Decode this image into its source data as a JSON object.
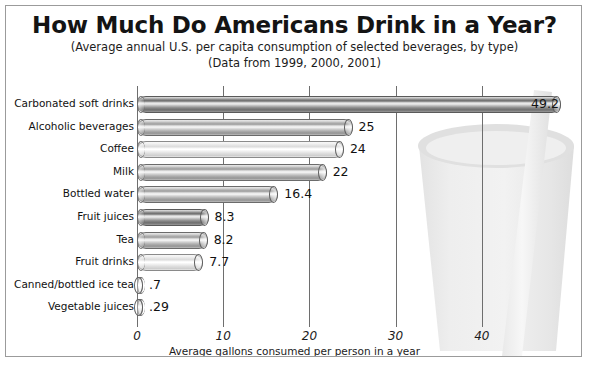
{
  "chart_data": {
    "type": "bar",
    "orientation": "horizontal",
    "title": "How Much Do Americans Drink in a Year?",
    "subtitle1": "(Average annual U.S. per capita consumption of selected beverages, by type)",
    "subtitle2": "(Data from 1999, 2000, 2001)",
    "xlabel": "Average gallons consumed per person in a year",
    "ylabel": "",
    "xlim": [
      0,
      50
    ],
    "xticks": [
      0,
      10,
      20,
      30,
      40
    ],
    "xtick_labels": [
      "0",
      "10",
      "20",
      "30",
      "40"
    ],
    "grid": true,
    "legend": "none",
    "categories": [
      "Carbonated soft drinks",
      "Alcoholic beverages",
      "Coffee",
      "Milk",
      "Bottled water",
      "Fruit juices",
      "Tea",
      "Fruit drinks",
      "Canned/bottled ice tea",
      "Vegetable juices"
    ],
    "values": [
      49.2,
      25,
      24,
      22,
      16.4,
      8.3,
      8.2,
      7.7,
      0.7,
      0.29
    ],
    "value_labels": [
      "49.2",
      "25",
      "24",
      "22",
      "16.4",
      "8.3",
      "8.2",
      "7.7",
      ".7",
      ".29"
    ],
    "bar_shades": [
      "dark",
      "mid",
      "light",
      "mid",
      "mid",
      "dark",
      "mid",
      "light",
      "light",
      "mid"
    ],
    "label_inside": [
      true,
      false,
      false,
      false,
      false,
      false,
      false,
      false,
      false,
      false
    ],
    "annotations": [
      "background watermark illustration of a drinking cup with a straw"
    ]
  },
  "colors": {
    "frame_border": "#9b9b9b",
    "gridline": "#6e6e6e",
    "text": "#141414",
    "background": "#ffffff",
    "watermark": "#e4e4e4"
  }
}
